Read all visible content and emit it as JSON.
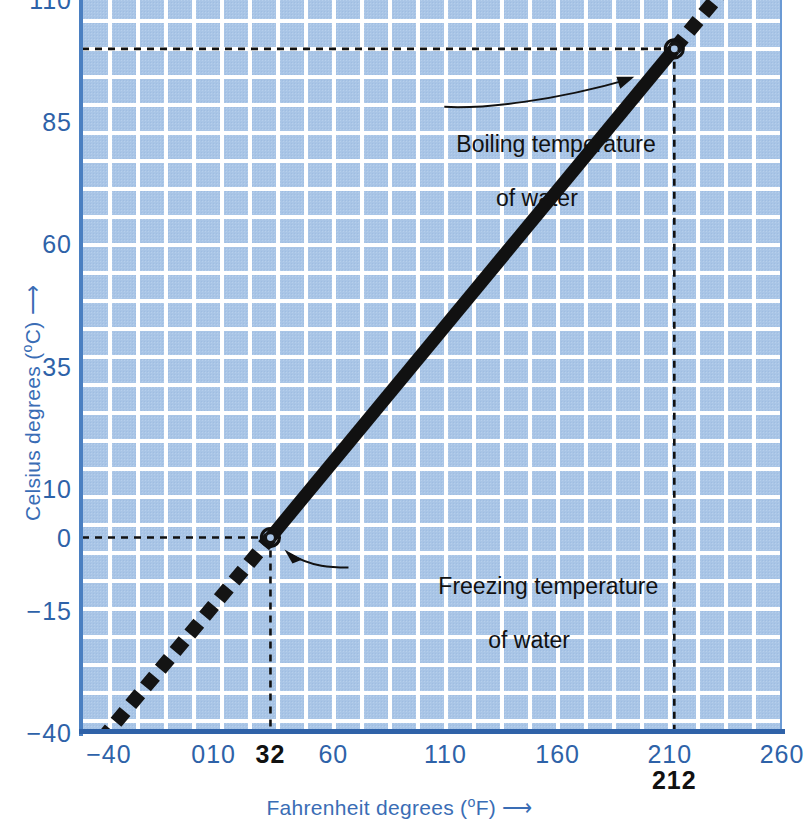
{
  "chart_data": {
    "type": "line",
    "title": "",
    "xlabel": "Fahrenheit degrees (°F) ⟶",
    "ylabel": "Celsius degrees (°C) ⟶",
    "xlabel_main": "Fahrenheit degrees (",
    "xlabel_unit": "o",
    "xlabel_tail": "F) ",
    "ylabel_main": "Celsius degrees (",
    "ylabel_unit": "o",
    "ylabel_tail": "C) ",
    "arrow_glyph": "⟶",
    "xlim": [
      -52,
      260
    ],
    "ylim": [
      -40,
      110
    ],
    "grid": true,
    "legend": null,
    "x_ticks": [
      {
        "value": -40,
        "label": "-40",
        "highlight": false
      },
      {
        "value": 0,
        "label": "0",
        "highlight": false
      },
      {
        "value": 10,
        "label": "10",
        "highlight": false
      },
      {
        "value": 32,
        "label": "32",
        "highlight": true
      },
      {
        "value": 60,
        "label": "60",
        "highlight": false
      },
      {
        "value": 110,
        "label": "110",
        "highlight": false
      },
      {
        "value": 160,
        "label": "160",
        "highlight": false
      },
      {
        "value": 210,
        "label": "210",
        "highlight": false
      },
      {
        "value": 260,
        "label": "260",
        "highlight": false
      }
    ],
    "x_ticks_below": [
      {
        "value": 212,
        "label": "212"
      }
    ],
    "y_ticks": [
      {
        "value": 110,
        "label": "110"
      },
      {
        "value": 85,
        "label": "85"
      },
      {
        "value": 60,
        "label": "60"
      },
      {
        "value": 35,
        "label": "35"
      },
      {
        "value": 10,
        "label": "10"
      },
      {
        "value": 0,
        "label": "0"
      },
      {
        "value": -15,
        "label": "-15"
      },
      {
        "value": -40,
        "label": "-40"
      }
    ],
    "series": [
      {
        "name": "Fahrenheit to Celsius conversion",
        "style": "solid-thick",
        "points": [
          [
            32,
            0
          ],
          [
            212,
            100
          ]
        ]
      },
      {
        "name": "Extrapolated range",
        "style": "dashed-thick",
        "points": [
          [
            -48,
            -44
          ],
          [
            32,
            0
          ],
          [
            212,
            100
          ],
          [
            232,
            111
          ]
        ]
      }
    ],
    "markers": [
      {
        "label": "Freezing temperature of water",
        "x": 32,
        "y": 0
      },
      {
        "label": "Boiling temperature of water",
        "x": 212,
        "y": 100
      }
    ],
    "annotations": [
      {
        "id": "boiling",
        "line1": "Boiling temperature",
        "line2": "of water"
      },
      {
        "id": "freezing",
        "line1": "Freezing temperature",
        "line2": "of water"
      }
    ],
    "guide_lines": [
      {
        "type": "horizontal",
        "value": 100,
        "from_x": -52,
        "to_x": 212,
        "style": "dashed"
      },
      {
        "type": "vertical",
        "value": 212,
        "from_y": -40,
        "to_y": 100,
        "style": "dashed"
      },
      {
        "type": "horizontal",
        "value": 0,
        "from_x": -52,
        "to_x": 32,
        "style": "dashed"
      },
      {
        "type": "vertical",
        "value": 32,
        "from_y": -40,
        "to_y": 0,
        "style": "dashed"
      }
    ],
    "colors": {
      "plot_background": "#a9c5e6",
      "grid": "#ffffff",
      "axis": "#2f62a8",
      "tick_label": "#2e62a8",
      "axis_title": "#3a6db5",
      "data_line": "#111111",
      "annotation_text": "#111111",
      "highlight_label": "#111111"
    }
  }
}
